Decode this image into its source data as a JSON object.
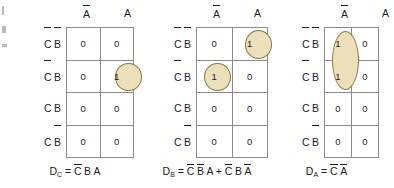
{
  "figure": {
    "type": "karnaugh-map-set",
    "map_count": 3,
    "highlight_fill": "#ece0bb",
    "highlight_stroke": "#8a7a42",
    "grid_stroke": "#8a8a8a"
  },
  "column_headers": [
    "A̅",
    "A"
  ],
  "row_headers": [
    "C̅ B̅",
    "C̅ B",
    "C B",
    "C B̅"
  ],
  "maps": [
    {
      "id": "map-dc",
      "output": "D_C",
      "output_base": "D",
      "output_sub": "C",
      "equation_terms": [
        [
          {
            "t": "C",
            "bar": true
          },
          {
            "t": "B",
            "bar": false
          },
          {
            "t": "A",
            "bar": false
          }
        ]
      ],
      "equation_text": "D_C = C̅ B A",
      "columns": [
        "A̅",
        "A"
      ],
      "rows": [
        "C̅ B̅",
        "C̅ B",
        "C B",
        "C B̅"
      ],
      "cells": [
        [
          "0",
          "0"
        ],
        [
          "0",
          "1"
        ],
        [
          "0",
          "0"
        ],
        [
          "0",
          "0"
        ]
      ],
      "groups": [
        {
          "name": "group-cell-r1c1",
          "row": 1,
          "col": 1,
          "row_span": 1,
          "col_span": 1,
          "shape": "circle"
        }
      ]
    },
    {
      "id": "map-db",
      "output": "D_B",
      "output_base": "D",
      "output_sub": "B",
      "equation_terms": [
        [
          {
            "t": "C",
            "bar": true
          },
          {
            "t": "B",
            "bar": true
          },
          {
            "t": "A",
            "bar": false
          }
        ],
        [
          {
            "t": "C",
            "bar": true
          },
          {
            "t": "B",
            "bar": false
          },
          {
            "t": "A",
            "bar": true
          }
        ]
      ],
      "equation_text": "D_B = C̅ B̅ A + C̅ B A̅",
      "columns": [
        "A̅",
        "A"
      ],
      "rows": [
        "C̅ B̅",
        "C̅ B",
        "C B",
        "C B̅"
      ],
      "cells": [
        [
          "0",
          "1"
        ],
        [
          "1",
          "0"
        ],
        [
          "0",
          "0"
        ],
        [
          "0",
          "0"
        ]
      ],
      "groups": [
        {
          "name": "group-cell-r0c1",
          "row": 0,
          "col": 1,
          "row_span": 1,
          "col_span": 1,
          "shape": "circle"
        },
        {
          "name": "group-cell-r1c0",
          "row": 1,
          "col": 0,
          "row_span": 1,
          "col_span": 1,
          "shape": "circle"
        }
      ]
    },
    {
      "id": "map-da",
      "output": "D_A",
      "output_base": "D",
      "output_sub": "A",
      "equation_terms": [
        [
          {
            "t": "C",
            "bar": true
          },
          {
            "t": "A",
            "bar": true
          }
        ]
      ],
      "equation_text": "D_A = C̅ A̅",
      "columns": [
        "A̅",
        "A"
      ],
      "rows": [
        "C̅ B̅",
        "C̅ B",
        "C B",
        "C B̅"
      ],
      "cells": [
        [
          "1",
          "0"
        ],
        [
          "1",
          "0"
        ],
        [
          "0",
          "0"
        ],
        [
          "0",
          "0"
        ]
      ],
      "groups": [
        {
          "name": "group-pair-r0r1c0",
          "row": 0,
          "col": 0,
          "row_span": 2,
          "col_span": 1,
          "shape": "ellipse"
        }
      ]
    }
  ]
}
